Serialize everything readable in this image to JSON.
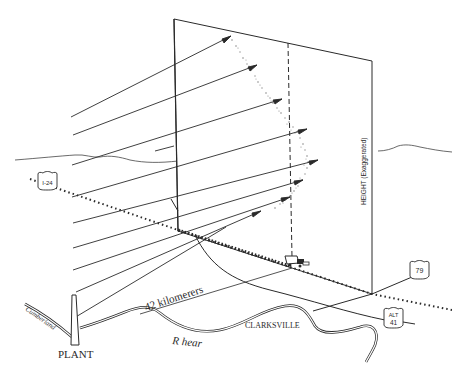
{
  "diagram": {
    "colors": {
      "ink": "#2a2a2a",
      "background": "#ffffff",
      "stipple": "#8a8a8a"
    },
    "labels": {
      "height_axis": "HEIGHT (Exaggerated)",
      "distance": "42 kilomerers",
      "river": "R hear",
      "river_name": "Cumberland",
      "town": "CLARKSVILLE",
      "plant": "PLANT"
    },
    "route_shields": [
      {
        "id": "i24",
        "label": "I-24"
      },
      {
        "id": "us79",
        "label": "79"
      },
      {
        "id": "alt41_top",
        "label": "ALT"
      },
      {
        "id": "alt41_num",
        "label": "41"
      }
    ]
  }
}
